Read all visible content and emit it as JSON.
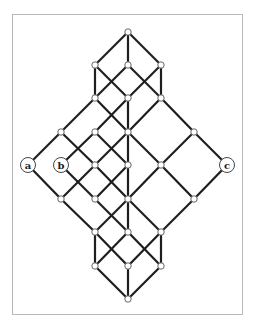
{
  "diagram": {
    "type": "lattice",
    "frame": {
      "x": 12,
      "y": 14,
      "width": 231,
      "height": 301,
      "color": "#b8b8b8"
    },
    "colors": {
      "edge": "#1e1e1e",
      "node_fill": "#ffffff",
      "node_stroke": "#555555"
    },
    "nodes": [
      {
        "id": "T",
        "x": 128,
        "y": 32
      },
      {
        "id": "A1",
        "x": 95,
        "y": 65
      },
      {
        "id": "A2",
        "x": 128,
        "y": 65
      },
      {
        "id": "A3",
        "x": 161,
        "y": 65
      },
      {
        "id": "B1",
        "x": 95,
        "y": 98
      },
      {
        "id": "B2",
        "x": 128,
        "y": 98
      },
      {
        "id": "B3",
        "x": 161,
        "y": 98
      },
      {
        "id": "C1",
        "x": 61,
        "y": 132
      },
      {
        "id": "C2",
        "x": 95,
        "y": 132
      },
      {
        "id": "C3",
        "x": 128,
        "y": 132
      },
      {
        "id": "C4",
        "x": 194,
        "y": 132
      },
      {
        "id": "a",
        "x": 28,
        "y": 165,
        "label": "a"
      },
      {
        "id": "b",
        "x": 61,
        "y": 165,
        "label": "b"
      },
      {
        "id": "D3",
        "x": 95,
        "y": 165
      },
      {
        "id": "D4",
        "x": 128,
        "y": 165
      },
      {
        "id": "D5",
        "x": 161,
        "y": 165
      },
      {
        "id": "c",
        "x": 227,
        "y": 165,
        "label": "c"
      },
      {
        "id": "E1",
        "x": 61,
        "y": 199
      },
      {
        "id": "E2",
        "x": 95,
        "y": 199
      },
      {
        "id": "E3",
        "x": 128,
        "y": 199
      },
      {
        "id": "E4",
        "x": 194,
        "y": 199
      },
      {
        "id": "F1",
        "x": 95,
        "y": 232
      },
      {
        "id": "F2",
        "x": 128,
        "y": 232
      },
      {
        "id": "F3",
        "x": 161,
        "y": 232
      },
      {
        "id": "G1",
        "x": 95,
        "y": 266
      },
      {
        "id": "G2",
        "x": 128,
        "y": 266
      },
      {
        "id": "G3",
        "x": 161,
        "y": 266
      },
      {
        "id": "Bot",
        "x": 128,
        "y": 299
      }
    ],
    "edges": [
      [
        "T",
        "A1"
      ],
      [
        "T",
        "A2"
      ],
      [
        "T",
        "A3"
      ],
      [
        "A1",
        "B1"
      ],
      [
        "A1",
        "B2"
      ],
      [
        "A2",
        "B1"
      ],
      [
        "A2",
        "B3"
      ],
      [
        "A3",
        "B2"
      ],
      [
        "A3",
        "B3"
      ],
      [
        "B1",
        "C1"
      ],
      [
        "B1",
        "C3"
      ],
      [
        "B2",
        "C2"
      ],
      [
        "B2",
        "C3"
      ],
      [
        "B3",
        "C3"
      ],
      [
        "B3",
        "C4"
      ],
      [
        "C1",
        "a"
      ],
      [
        "C1",
        "D3"
      ],
      [
        "C2",
        "b"
      ],
      [
        "C2",
        "D4"
      ],
      [
        "C3",
        "D3"
      ],
      [
        "C3",
        "D4"
      ],
      [
        "C3",
        "D5"
      ],
      [
        "C4",
        "D5"
      ],
      [
        "C4",
        "c"
      ],
      [
        "a",
        "E1"
      ],
      [
        "b",
        "E2"
      ],
      [
        "D3",
        "E1"
      ],
      [
        "D3",
        "E3"
      ],
      [
        "D4",
        "E2"
      ],
      [
        "D4",
        "E3"
      ],
      [
        "D5",
        "E3"
      ],
      [
        "D5",
        "E4"
      ],
      [
        "c",
        "E4"
      ],
      [
        "E1",
        "F1"
      ],
      [
        "E2",
        "F2"
      ],
      [
        "E3",
        "F1"
      ],
      [
        "E3",
        "F2"
      ],
      [
        "E3",
        "F3"
      ],
      [
        "E4",
        "F3"
      ],
      [
        "F1",
        "G1"
      ],
      [
        "F1",
        "G2"
      ],
      [
        "F2",
        "G1"
      ],
      [
        "F2",
        "G3"
      ],
      [
        "F3",
        "G2"
      ],
      [
        "F3",
        "G3"
      ],
      [
        "G1",
        "Bot"
      ],
      [
        "G2",
        "Bot"
      ],
      [
        "G3",
        "Bot"
      ]
    ],
    "labels": {
      "a": "a",
      "b": "b",
      "c": "c"
    }
  }
}
